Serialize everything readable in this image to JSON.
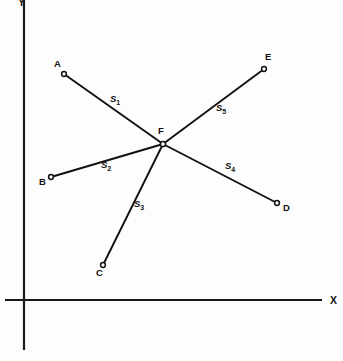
{
  "figure": {
    "width": 343,
    "height": 361,
    "background_color": "#fdfdfd",
    "line_color": "#111111"
  },
  "axes": {
    "x_axis": {
      "label": "X",
      "label_x": 330,
      "label_y": 295,
      "x1": 5,
      "y1": 300,
      "x2": 322,
      "y2": 300
    },
    "y_axis": {
      "label": "Y",
      "label_x": 18,
      "label_y": -3,
      "x1": 24,
      "y1": 0,
      "x2": 24,
      "y2": 350
    }
  },
  "nodes": [
    {
      "id": "F",
      "label": "F",
      "x": 163,
      "y": 144,
      "label_x": 158,
      "label_y": 126,
      "radius": 2.6
    },
    {
      "id": "A",
      "label": "A",
      "x": 64,
      "y": 74,
      "label_x": 54,
      "label_y": 59,
      "radius": 2.4
    },
    {
      "id": "B",
      "label": "B",
      "x": 51,
      "y": 177,
      "label_x": 39,
      "label_y": 177,
      "radius": 2.4
    },
    {
      "id": "C",
      "label": "C",
      "x": 103,
      "y": 265,
      "label_x": 96,
      "label_y": 268,
      "radius": 2.4
    },
    {
      "id": "D",
      "label": "D",
      "x": 277,
      "y": 203,
      "label_x": 283,
      "label_y": 203,
      "radius": 2.4
    },
    {
      "id": "E",
      "label": "E",
      "x": 264,
      "y": 69,
      "label_x": 265,
      "label_y": 52,
      "radius": 2.4
    }
  ],
  "segments": [
    {
      "id": "S1",
      "label": "S",
      "subscript": "1",
      "from": "F",
      "to": "A",
      "x1": 163,
      "y1": 144,
      "x2": 64,
      "y2": 74,
      "label_x": 110,
      "label_y": 94
    },
    {
      "id": "S2",
      "label": "S",
      "subscript": "2",
      "from": "F",
      "to": "B",
      "x1": 163,
      "y1": 144,
      "x2": 51,
      "y2": 177,
      "label_x": 101,
      "label_y": 160
    },
    {
      "id": "S3",
      "label": "S",
      "subscript": "3",
      "from": "F",
      "to": "C",
      "x1": 163,
      "y1": 144,
      "x2": 103,
      "y2": 265,
      "label_x": 134,
      "label_y": 199
    },
    {
      "id": "S4",
      "label": "S",
      "subscript": "4",
      "from": "F",
      "to": "D",
      "x1": 163,
      "y1": 144,
      "x2": 277,
      "y2": 203,
      "label_x": 225,
      "label_y": 161
    },
    {
      "id": "S5",
      "label": "S",
      "subscript": "5",
      "from": "F",
      "to": "E",
      "x1": 163,
      "y1": 144,
      "x2": 264,
      "y2": 69,
      "label_x": 216,
      "label_y": 103
    }
  ],
  "chart_data": {
    "type": "scatter",
    "xlabel": "X",
    "ylabel": "Y",
    "grid": false,
    "legend": null,
    "points": [
      {
        "name": "F",
        "px": 163,
        "py": 144
      },
      {
        "name": "A",
        "px": 64,
        "py": 74
      },
      {
        "name": "B",
        "px": 51,
        "py": 177
      },
      {
        "name": "C",
        "px": 103,
        "py": 265
      },
      {
        "name": "D",
        "px": 277,
        "py": 203
      },
      {
        "name": "E",
        "px": 264,
        "py": 69
      }
    ],
    "edges": [
      {
        "name": "S1",
        "from": "F",
        "to": "A"
      },
      {
        "name": "S2",
        "from": "F",
        "to": "B"
      },
      {
        "name": "S3",
        "from": "F",
        "to": "C"
      },
      {
        "name": "S4",
        "from": "F",
        "to": "D"
      },
      {
        "name": "S5",
        "from": "F",
        "to": "E"
      }
    ],
    "annotations": [
      "A",
      "B",
      "C",
      "D",
      "E",
      "F",
      "S1",
      "S2",
      "S3",
      "S4",
      "S5",
      "X",
      "Y"
    ]
  }
}
